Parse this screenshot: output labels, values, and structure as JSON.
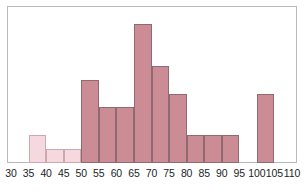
{
  "chart_data": {
    "type": "bar",
    "title": "",
    "subtitle": "",
    "xlabel": "",
    "ylabel": "",
    "bin_width": 5,
    "grid": false,
    "legend": "none",
    "xlim": [
      30,
      110
    ],
    "ylim": [
      0,
      11
    ],
    "xticks": [
      30,
      35,
      40,
      45,
      50,
      55,
      60,
      65,
      70,
      75,
      80,
      85,
      90,
      95,
      100,
      105,
      110
    ],
    "xtick_labels": [
      "30",
      "35",
      "40",
      "45",
      "50",
      "55",
      "60",
      "65",
      "70",
      "75",
      "80",
      "85",
      "90",
      "95",
      "100",
      "105",
      "110"
    ],
    "yticks": [],
    "ytick_labels": [],
    "colors": {
      "bar_fill_dark": "#cc8c95",
      "bar_fill_light": "#f5d9de",
      "bar_edge_dark": "#8e6b70",
      "bar_edge_light": "#cfa8ae",
      "frame": "#b9b9bb",
      "background": "#ffffff",
      "tick_text": "#1d1d1f"
    },
    "bins": [
      {
        "label": "30-35",
        "start": 30,
        "end": 35,
        "value": 0,
        "shade": "light"
      },
      {
        "label": "35-40",
        "start": 35,
        "end": 40,
        "value": 2,
        "shade": "light"
      },
      {
        "label": "40-45",
        "start": 40,
        "end": 45,
        "value": 1,
        "shade": "light"
      },
      {
        "label": "45-50",
        "start": 45,
        "end": 50,
        "value": 1,
        "shade": "light"
      },
      {
        "label": "50-55",
        "start": 50,
        "end": 55,
        "value": 6,
        "shade": "dark"
      },
      {
        "label": "55-60",
        "start": 55,
        "end": 60,
        "value": 4,
        "shade": "dark"
      },
      {
        "label": "60-65",
        "start": 60,
        "end": 65,
        "value": 4,
        "shade": "dark"
      },
      {
        "label": "65-70",
        "start": 65,
        "end": 70,
        "value": 10,
        "shade": "dark"
      },
      {
        "label": "70-75",
        "start": 70,
        "end": 75,
        "value": 7,
        "shade": "dark"
      },
      {
        "label": "75-80",
        "start": 75,
        "end": 80,
        "value": 5,
        "shade": "dark"
      },
      {
        "label": "80-85",
        "start": 80,
        "end": 85,
        "value": 2,
        "shade": "dark"
      },
      {
        "label": "85-90",
        "start": 85,
        "end": 90,
        "value": 2,
        "shade": "dark"
      },
      {
        "label": "90-95",
        "start": 90,
        "end": 95,
        "value": 2,
        "shade": "dark"
      },
      {
        "label": "95-100",
        "start": 95,
        "end": 100,
        "value": 0,
        "shade": "dark"
      },
      {
        "label": "100-105",
        "start": 100,
        "end": 105,
        "value": 5,
        "shade": "dark"
      },
      {
        "label": "105-110",
        "start": 105,
        "end": 110,
        "value": 0,
        "shade": "dark"
      }
    ],
    "categories": [
      "30-35",
      "35-40",
      "40-45",
      "45-50",
      "50-55",
      "55-60",
      "60-65",
      "65-70",
      "70-75",
      "75-80",
      "80-85",
      "85-90",
      "90-95",
      "95-100",
      "100-105",
      "105-110"
    ],
    "values": [
      0,
      2,
      1,
      1,
      6,
      4,
      4,
      10,
      7,
      5,
      2,
      2,
      2,
      0,
      5,
      0
    ]
  },
  "plot": {
    "frame_left": 7,
    "frame_top": 6,
    "frame_right": 297,
    "baseline_y": 163,
    "x_at_30": 11,
    "px_per_unit_x": 3.5125,
    "px_per_unit_y": 13.9
  }
}
